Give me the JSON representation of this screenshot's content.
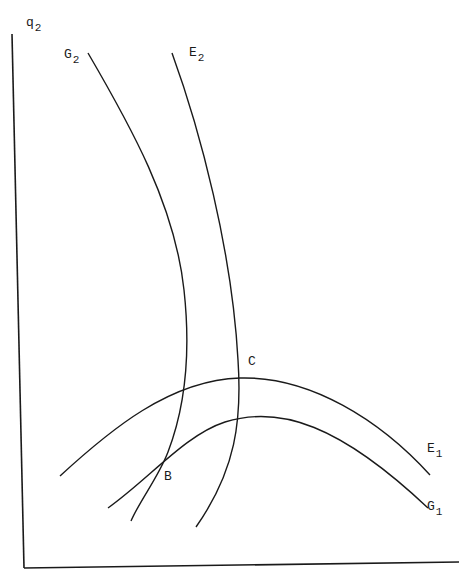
{
  "diagram": {
    "type": "indifference/trade curves diagram",
    "axis": {
      "y_label": {
        "base": "q",
        "sub": "2"
      },
      "x_label": null
    },
    "curves": [
      {
        "id": "G2",
        "label": {
          "base": "G",
          "sub": "2"
        }
      },
      {
        "id": "E2",
        "label": {
          "base": "E",
          "sub": "2"
        }
      },
      {
        "id": "E1",
        "label": {
          "base": "E",
          "sub": "1"
        }
      },
      {
        "id": "G1",
        "label": {
          "base": "G",
          "sub": "1"
        }
      }
    ],
    "points": [
      {
        "id": "C",
        "label": "C"
      },
      {
        "id": "B",
        "label": "B"
      }
    ],
    "colors": {
      "ink": "#1a1a1a",
      "background": "#ffffff"
    }
  }
}
